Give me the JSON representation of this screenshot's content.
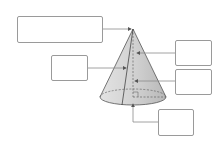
{
  "diagram": {
    "colors": {
      "line": "#8a8a8a",
      "cone_fill": "#d9d9d9",
      "cone_dark": "#bdbdbd",
      "outline": "#555555"
    },
    "label_boxes": [
      {
        "id": "apex",
        "text": "",
        "points_to": "apex"
      },
      {
        "id": "slant-height",
        "text": "",
        "points_to": "slant height"
      },
      {
        "id": "height-upper",
        "text": "",
        "points_to": "height (axis)"
      },
      {
        "id": "height-lower",
        "text": "",
        "points_to": "height (axis)"
      },
      {
        "id": "base-center",
        "text": "",
        "points_to": "base center"
      }
    ]
  }
}
